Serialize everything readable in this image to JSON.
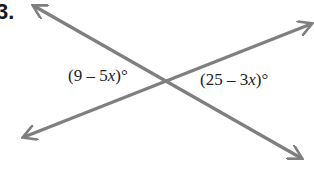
{
  "problem_number": "3.",
  "angles": [
    {
      "pre": "(9 – 5",
      "var": "x",
      "post": ")°"
    },
    {
      "pre": "(25 – 3",
      "var": "x",
      "post": ")°"
    }
  ],
  "colors": {
    "line": "#7f7f7f",
    "text": "#222222"
  }
}
